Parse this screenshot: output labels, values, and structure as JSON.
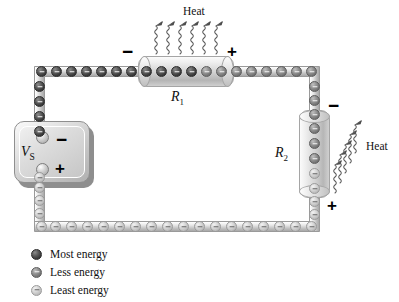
{
  "figure": {
    "type": "circuit-diagram"
  },
  "source": {
    "label": "V",
    "label_sub": "S",
    "name": "voltage-source",
    "terminals": {
      "negative": "−",
      "positive": "+"
    }
  },
  "resistors": [
    {
      "id": "r1",
      "label": "R",
      "label_sub": "1",
      "orientation": "horizontal",
      "terminal_left": "−",
      "terminal_right": "+",
      "heat_label": "Heat"
    },
    {
      "id": "r2",
      "label": "R",
      "label_sub": "2",
      "orientation": "vertical",
      "terminal_top": "−",
      "terminal_bottom": "+",
      "heat_label": "Heat"
    }
  ],
  "legend": {
    "items": [
      {
        "key": "most",
        "label": "Most energy",
        "color": "#3b3b3b"
      },
      {
        "key": "less",
        "label": "Less energy",
        "color": "#767676"
      },
      {
        "key": "least",
        "label": "Least energy",
        "color": "#bdbdbd"
      }
    ]
  },
  "electrons": {
    "top_left_wire": {
      "energy": "most",
      "count": 7
    },
    "left_upper_wire": {
      "energy": "most",
      "count": 4
    },
    "inside_r1": {
      "energy": "gradient-most-to-less",
      "count": 8
    },
    "top_right_wire": {
      "energy": "less",
      "count": 7
    },
    "right_upper_wire": {
      "energy": "less",
      "count": 4
    },
    "inside_r2": {
      "energy": "gradient-less-to-least",
      "count": 6
    },
    "right_lower_wire": {
      "energy": "least",
      "count": 4
    },
    "bottom_wire": {
      "energy": "least",
      "count": 18
    },
    "left_lower_wire": {
      "energy": "least",
      "count": 4
    }
  },
  "colors": {
    "wire": "#c2c2c2",
    "wire_border": "#9a9a9a",
    "most_energy": "#3b3b3b",
    "less_energy": "#767676",
    "least_energy": "#bdbdbd",
    "heat_arrow": "#555555",
    "text": "#111111",
    "background": "#ffffff"
  }
}
